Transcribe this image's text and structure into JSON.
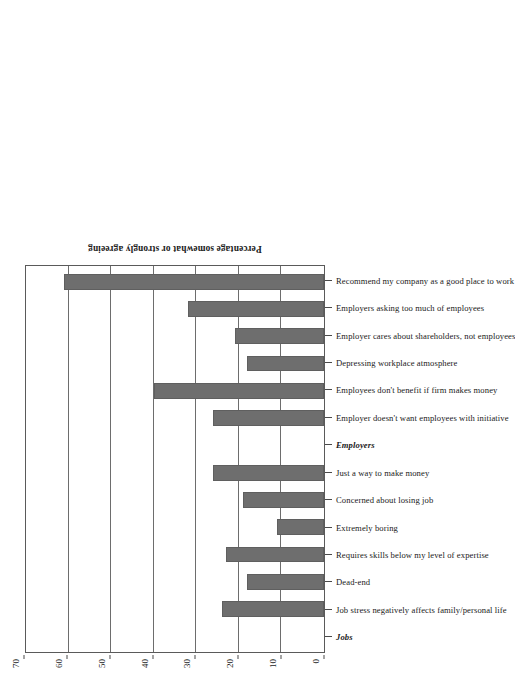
{
  "chart_data": {
    "type": "bar",
    "title": "",
    "xlabel": "",
    "ylabel": "Percentage somewhat or strongly agreeing",
    "ylim": [
      0,
      70
    ],
    "yticks": [
      0,
      10,
      20,
      30,
      40,
      50,
      60,
      70
    ],
    "grid": true,
    "legend": "none",
    "orientation": "vertical-bars-rotated-90",
    "bar_color": "#6e6e6e",
    "categories": [
      "Jobs",
      "Job stress negatively affects family/personal life",
      "Dead-end",
      "Requires skills below my level of expertise",
      "Extremely boring",
      "Concerned about losing job",
      "Just a way to make money",
      "Employers",
      "Employer doesn't want employees with initiative",
      "Employees don't benefit if firm makes money",
      "Depressing workplace atmosphere",
      "Employer cares about shareholders, not employees",
      "Employers asking too much of employees",
      "Recommend my company as a good place to work"
    ],
    "values": [
      null,
      24,
      18,
      23,
      11,
      19,
      26,
      null,
      26,
      40,
      18,
      21,
      32,
      61
    ],
    "group_headers": [
      "Jobs",
      "Employers"
    ],
    "groups": [
      {
        "name": "Jobs",
        "items": [
          {
            "label": "Job stress negatively affects family/personal life",
            "value": 24
          },
          {
            "label": "Dead-end",
            "value": 18
          },
          {
            "label": "Requires skills below my level of expertise",
            "value": 23
          },
          {
            "label": "Extremely boring",
            "value": 11
          },
          {
            "label": "Concerned about losing job",
            "value": 19
          },
          {
            "label": "Just a way to make money",
            "value": 26
          }
        ]
      },
      {
        "name": "Employers",
        "items": [
          {
            "label": "Employer doesn't want employees with initiative",
            "value": 26
          },
          {
            "label": "Employees don't benefit if firm makes money",
            "value": 40
          },
          {
            "label": "Depressing workplace atmosphere",
            "value": 18
          },
          {
            "label": "Employer cares about shareholders, not employees",
            "value": 21
          },
          {
            "label": "Employers asking too much of employees",
            "value": 32
          },
          {
            "label": "Recommend my company as a good place to work",
            "value": 61
          }
        ]
      }
    ]
  }
}
